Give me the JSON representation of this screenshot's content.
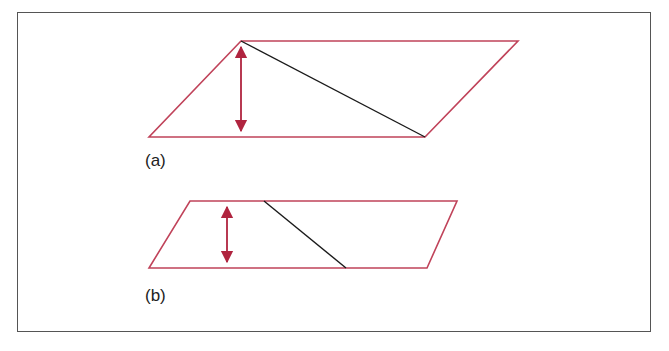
{
  "figure": {
    "colors": {
      "shape_outline": "#c0435a",
      "height_arrow": "#b0243f",
      "diagonal": "#1a1a1a",
      "frame": "#555555"
    },
    "panels": [
      {
        "label": "(a)",
        "parallelogram": [
          [
            241,
            41
          ],
          [
            518,
            41
          ],
          [
            425,
            137
          ],
          [
            149,
            137
          ]
        ],
        "diagonal": [
          [
            241,
            41
          ],
          [
            425,
            137
          ]
        ],
        "height_arrow": {
          "x": 241,
          "y1": 45,
          "y2": 133
        }
      },
      {
        "label": "(b)",
        "parallelogram": [
          [
            190,
            201
          ],
          [
            457,
            201
          ],
          [
            427,
            268
          ],
          [
            149,
            268
          ]
        ],
        "diagonal": [
          [
            264,
            201
          ],
          [
            346,
            268
          ]
        ],
        "height_arrow": {
          "x": 227,
          "y1": 205,
          "y2": 264
        }
      }
    ]
  },
  "caption": {
    "text": ""
  }
}
